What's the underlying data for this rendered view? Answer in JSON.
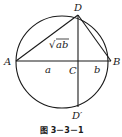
{
  "figure": {
    "caption": "图 3－3－1",
    "labels": {
      "A": "A",
      "B": "B",
      "C": "C",
      "D": "D",
      "D_prime": "D′",
      "a": "a",
      "b": "b",
      "sqrt_ab_radicand": "ab",
      "sqrt_symbol": "√"
    },
    "geometry": {
      "circle": {
        "cx": 62,
        "cy": 62,
        "r": 46
      },
      "A": [
        16,
        61
      ],
      "B": [
        111,
        61
      ],
      "C": [
        78,
        61
      ],
      "D": [
        78,
        15
      ],
      "D_prime": [
        78,
        107
      ]
    },
    "colors": {
      "stroke": "#1a1a1a",
      "background": "#ffffff"
    }
  }
}
